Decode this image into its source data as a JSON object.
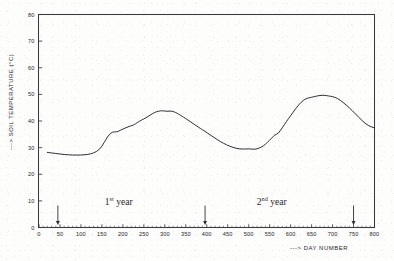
{
  "chart_data": {
    "type": "line",
    "title": "",
    "xlabel": "---> DAY NUMBER",
    "ylabel": "---> SOIL TEMPERATURE (°C)",
    "xlim": [
      0,
      800
    ],
    "ylim": [
      0,
      80
    ],
    "grid": false,
    "legend": "none",
    "x_ticks": [
      0,
      50,
      100,
      150,
      200,
      250,
      300,
      350,
      400,
      450,
      500,
      550,
      600,
      650,
      700,
      750,
      800
    ],
    "x_tick_labels": [
      "0",
      "50",
      "100",
      "150",
      "200",
      "250",
      "300",
      "350",
      "400",
      "450",
      "500",
      "550",
      "600",
      "650",
      "700",
      "750",
      "800"
    ],
    "x_minor_tick_step": 10,
    "y_ticks": [
      0,
      10,
      20,
      30,
      40,
      50,
      60,
      70,
      80
    ],
    "y_tick_labels": [
      "0",
      "10",
      "20",
      "30",
      "40",
      "50",
      "60",
      "70",
      "80"
    ],
    "series": [
      {
        "name": "Soil temperature",
        "x": [
          20,
          40,
          60,
          80,
          100,
          115,
          130,
          145,
          155,
          165,
          175,
          185,
          195,
          205,
          215,
          225,
          235,
          245,
          255,
          265,
          275,
          285,
          295,
          305,
          315,
          325,
          335,
          345,
          355,
          365,
          375,
          385,
          395,
          410,
          425,
          440,
          455,
          470,
          485,
          500,
          515,
          525,
          535,
          545,
          555,
          562,
          570,
          580,
          590,
          600,
          610,
          620,
          630,
          640,
          650,
          660,
          670,
          680,
          690,
          700,
          712,
          725,
          740,
          755,
          770,
          785,
          800
        ],
        "y": [
          28.2,
          27.8,
          27.4,
          27.2,
          27.2,
          27.4,
          27.9,
          29.3,
          31.8,
          34.5,
          36.0,
          35.8,
          36.6,
          37.3,
          38.0,
          38.4,
          39.5,
          40.4,
          41.2,
          42.2,
          43.2,
          43.7,
          43.9,
          43.6,
          43.8,
          43.3,
          42.4,
          41.4,
          40.4,
          39.3,
          38.2,
          37.2,
          36.2,
          34.6,
          33.0,
          31.6,
          30.5,
          29.7,
          29.4,
          29.6,
          29.3,
          29.8,
          30.6,
          32.0,
          33.6,
          34.8,
          35.2,
          37.4,
          39.8,
          42.0,
          44.2,
          46.2,
          47.8,
          48.6,
          48.9,
          49.3,
          49.6,
          49.7,
          49.4,
          49.2,
          48.5,
          47.0,
          45.0,
          42.6,
          40.2,
          38.2,
          37.4
        ]
      }
    ],
    "annotations": [
      {
        "text_main": "1",
        "text_sup": "st",
        "text_tail": "year",
        "x": 190
      },
      {
        "text_main": "2",
        "text_sup": "nd",
        "text_tail": "year",
        "x": 555
      }
    ],
    "arrow_markers": [
      {
        "label": "arrow-marker-1",
        "x": 45
      },
      {
        "label": "arrow-marker-2",
        "x": 396
      },
      {
        "label": "arrow-marker-3",
        "x": 750
      }
    ]
  }
}
